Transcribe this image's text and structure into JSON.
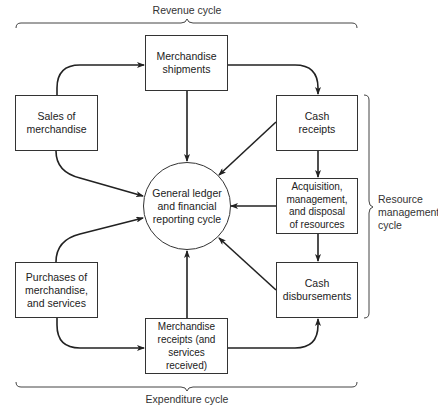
{
  "diagram": {
    "top_brace_label": "Revenue cycle",
    "bottom_brace_label": "Expenditure cycle",
    "right_brace_label": "Resource\nmanagement\ncycle",
    "center_node": "General ledger\nand financial\nreporting cycle",
    "nodes": {
      "merchandise_shipments": "Merchandise\nshipments",
      "sales_of_merchandise": "Sales of\nmerchandise",
      "cash_receipts": "Cash\nreceipts",
      "acquisition": "Acquisition,\nmanagement,\nand disposal\nof resources",
      "cash_disbursements": "Cash\ndisbursements",
      "purchases": "Purchases of\nmerchandise,\nand services",
      "merchandise_receipts": "Merchandise\nreceipts (and\nservices received)"
    },
    "edges": [
      {
        "from": "Sales of merchandise",
        "to": "Merchandise shipments"
      },
      {
        "from": "Merchandise shipments",
        "to": "Cash receipts"
      },
      {
        "from": "Merchandise shipments",
        "to": "General ledger and financial reporting cycle"
      },
      {
        "from": "Sales of merchandise",
        "to": "General ledger and financial reporting cycle"
      },
      {
        "from": "Cash receipts",
        "to": "General ledger and financial reporting cycle"
      },
      {
        "from": "Cash receipts",
        "to": "Acquisition, management, and disposal of resources"
      },
      {
        "from": "Acquisition, management, and disposal of resources",
        "to": "General ledger and financial reporting cycle"
      },
      {
        "from": "Acquisition, management, and disposal of resources",
        "to": "Cash disbursements"
      },
      {
        "from": "Cash disbursements",
        "to": "General ledger and financial reporting cycle"
      },
      {
        "from": "Purchases of merchandise, and services",
        "to": "General ledger and financial reporting cycle"
      },
      {
        "from": "Purchases of merchandise, and services",
        "to": "Merchandise receipts (and services received)"
      },
      {
        "from": "Merchandise receipts (and services received)",
        "to": "General ledger and financial reporting cycle"
      },
      {
        "from": "Merchandise receipts (and services received)",
        "to": "Cash disbursements"
      }
    ],
    "colors": {
      "line": "#222222",
      "box_border": "#333333",
      "background": "#ffffff"
    }
  }
}
